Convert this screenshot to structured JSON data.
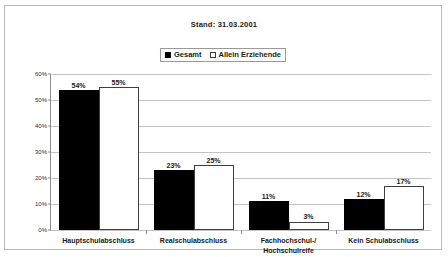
{
  "chart_data": {
    "type": "bar",
    "title": "Stand: 31.03.2001",
    "xlabel": "",
    "ylabel": "",
    "ylim": [
      0,
      60
    ],
    "ytick_labels": [
      "0%",
      "10%",
      "20%",
      "30%",
      "40%",
      "50%",
      "60%"
    ],
    "ytick_values": [
      0,
      10,
      20,
      30,
      40,
      50,
      60
    ],
    "grid": true,
    "legend_position": "top-center",
    "categories": [
      "Hauptschulabschluss",
      "Realschulabschluss",
      "Fachhochschul-/\nHochschulreife",
      "Kein Schulabschluss"
    ],
    "category_lines": [
      [
        "Hauptschulabschluss"
      ],
      [
        "Realschulabschluss"
      ],
      [
        "Fachhochschul-/",
        "Hochschulreife"
      ],
      [
        "Kein Schulabschluss"
      ]
    ],
    "series": [
      {
        "name": "Gesamt",
        "color": "#000000",
        "style": "filled",
        "values": [
          54,
          23,
          11,
          12
        ],
        "labels": [
          "54%",
          "23%",
          "11%",
          "12%"
        ]
      },
      {
        "name": "Allein Erziehende",
        "color": "#ffffff",
        "style": "hollow",
        "values": [
          55,
          25,
          3,
          17
        ],
        "labels": [
          "55%",
          "25%",
          "3%",
          "17%"
        ]
      }
    ]
  },
  "legend": {
    "entries": [
      {
        "label": "Gesamt",
        "swatch": "filled-square-icon"
      },
      {
        "label": "Allein Erziehende",
        "swatch": "hollow-square-icon"
      }
    ]
  }
}
